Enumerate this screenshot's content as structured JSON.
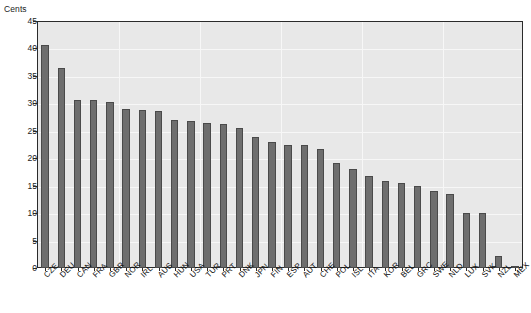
{
  "axis_unit_label": "Cents",
  "chart_data": {
    "type": "bar",
    "title": "",
    "xlabel": "",
    "ylabel": "Cents",
    "ylim": [
      0,
      45
    ],
    "ytick_step": 5,
    "yticks": [
      0,
      5,
      10,
      15,
      20,
      25,
      30,
      35,
      40,
      45
    ],
    "grid": true,
    "legend": "none",
    "bar_color": "#6e6e6e",
    "bar_edge_color": "#4a4a4a",
    "plot_background": "#e8e8e8",
    "categories": [
      "CZE",
      "DEU",
      "CAN",
      "FRA",
      "GBR",
      "NOR",
      "IRL",
      "AUS",
      "HUN",
      "USA",
      "TUR",
      "PRT",
      "DNK",
      "JPN",
      "FIN",
      "ESP",
      "AUT",
      "CHE",
      "POL",
      "ISL",
      "ITA",
      "KOR",
      "BEL",
      "GRC",
      "SWE",
      "NLD",
      "LUX",
      "SVK",
      "NZL",
      "MEX"
    ],
    "values": [
      40.7,
      36.4,
      30.6,
      30.6,
      30.3,
      29.0,
      28.8,
      28.6,
      27.0,
      26.8,
      26.5,
      26.2,
      25.5,
      23.8,
      23.0,
      22.4,
      22.4,
      21.6,
      19.2,
      18.0,
      16.8,
      15.8,
      15.4,
      15.0,
      14.0,
      13.4,
      10.1,
      10.0,
      2.2,
      0.2
    ]
  }
}
